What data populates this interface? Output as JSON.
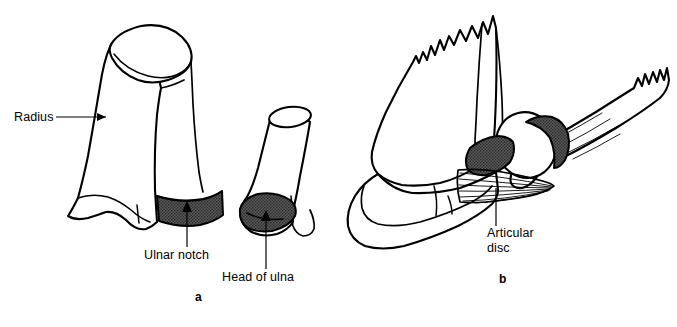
{
  "figure": {
    "domain": "anatomical-line-diagram",
    "background_color": "#ffffff",
    "ink_color": "#000000",
    "shading_color": "#4a4a4a",
    "panels": [
      {
        "id": "a",
        "letter": "a",
        "caption": "a",
        "description": "Separated distal radius and distal ulna showing the ulnar notch of the radius and the head of the ulna",
        "labels": [
          {
            "name": "radius",
            "text": "Radius",
            "leader": "horizontal-arrow-right"
          },
          {
            "name": "ulnar-notch",
            "text": "Ulnar notch",
            "leader": "vertical-arrow-up"
          },
          {
            "name": "head-of-ulna",
            "text": "Head of ulna",
            "leader": "vertical-arrow-up"
          }
        ]
      },
      {
        "id": "b",
        "letter": "b",
        "caption": "b",
        "description": "Distal radioulnar joint in articulation with the carpus, showing the articular disc",
        "labels": [
          {
            "name": "articular-disc",
            "text_line_1": "Articular",
            "text_line_2": "disc",
            "leader": "vertical-line"
          }
        ]
      }
    ],
    "labels_flat": {
      "radius": "Radius",
      "ulnar_notch": "Ulnar notch",
      "head_of_ulna": "Head of ulna",
      "articular_disc_line1": "Articular",
      "articular_disc_line2": "disc",
      "panel_a_letter": "a",
      "panel_b_letter": "b"
    }
  }
}
